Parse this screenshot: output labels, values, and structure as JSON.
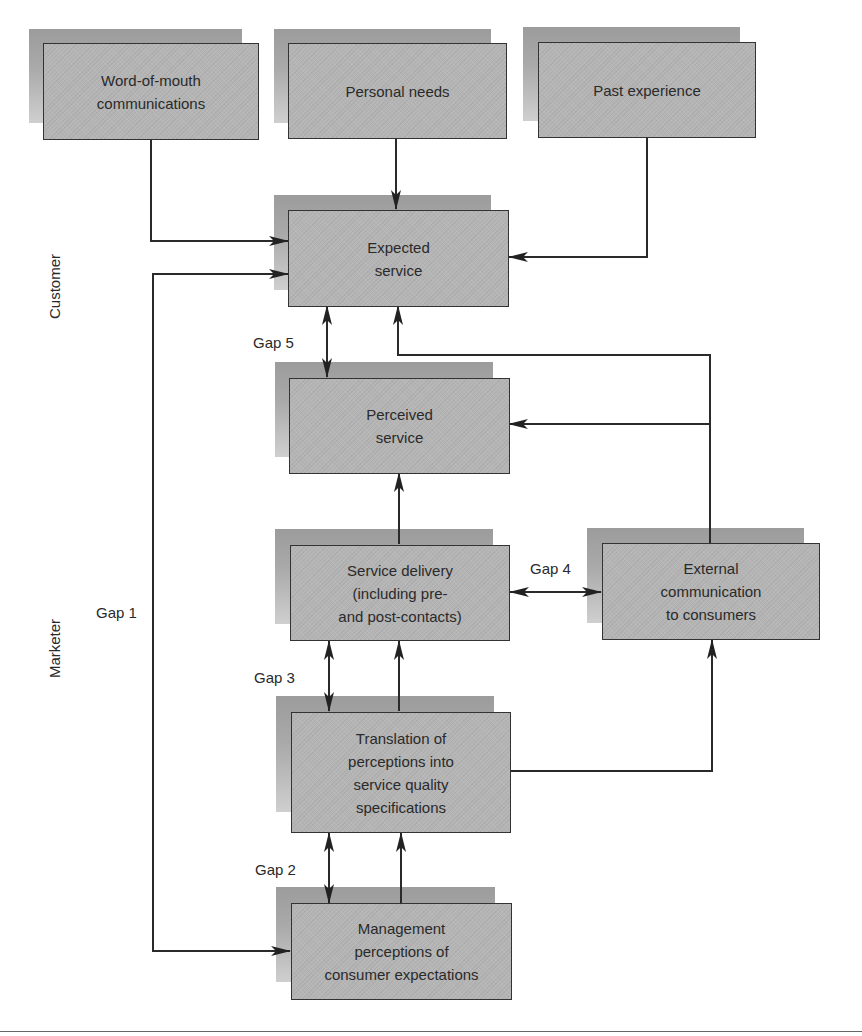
{
  "diagram": {
    "title": "",
    "side_labels": {
      "customer": "Customer",
      "marketer": "Marketer"
    },
    "nodes": {
      "word_of_mouth": "Word-of-mouth\ncommunications",
      "personal_needs": "Personal needs",
      "past_experience": "Past experience",
      "expected_service": "Expected\nservice",
      "perceived_service": "Perceived\nservice",
      "service_delivery": "Service delivery\n(including pre-\nand post-contacts)",
      "external_communication": "External\ncommunication\nto consumers",
      "translation": "Translation of\nperceptions into\nservice quality\nspecifications",
      "management_perceptions": "Management\nperceptions of\nconsumer expectations"
    },
    "gaps": {
      "gap1": "Gap 1",
      "gap2": "Gap 2",
      "gap3": "Gap 3",
      "gap4": "Gap 4",
      "gap5": "Gap 5"
    },
    "edges": [
      {
        "from": "Word-of-mouth communications",
        "to": "Expected service"
      },
      {
        "from": "Personal needs",
        "to": "Expected service"
      },
      {
        "from": "Past experience",
        "to": "Expected service"
      },
      {
        "from": "Management perceptions of consumer expectations",
        "to": "Expected service",
        "label": "Gap 1",
        "bidirectional": true
      },
      {
        "from": "Management perceptions of consumer expectations",
        "to": "Translation of perceptions into service quality specifications",
        "label": "Gap 2",
        "bidirectional": true
      },
      {
        "from": "Management perceptions of consumer expectations",
        "to": "Translation of perceptions into service quality specifications"
      },
      {
        "from": "Translation of perceptions into service quality specifications",
        "to": "Service delivery (including pre- and post-contacts)",
        "label": "Gap 3",
        "bidirectional": true
      },
      {
        "from": "Translation of perceptions into service quality specifications",
        "to": "Service delivery (including pre- and post-contacts)"
      },
      {
        "from": "Translation of perceptions into service quality specifications",
        "to": "External communication to consumers"
      },
      {
        "from": "Service delivery (including pre- and post-contacts)",
        "to": "External communication to consumers",
        "label": "Gap 4",
        "bidirectional": true
      },
      {
        "from": "Service delivery (including pre- and post-contacts)",
        "to": "Perceived service"
      },
      {
        "from": "External communication to consumers",
        "to": "Expected service"
      },
      {
        "from": "External communication to consumers",
        "to": "Perceived service"
      },
      {
        "from": "Perceived service",
        "to": "Expected service",
        "label": "Gap 5",
        "bidirectional": true
      }
    ],
    "colors": {
      "box_fill": "#b5b5b5",
      "box_shadow": "#a0a0a0",
      "stroke": "#333333"
    }
  }
}
